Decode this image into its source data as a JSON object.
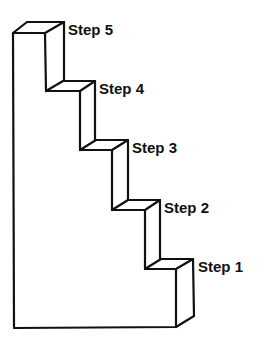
{
  "diagram": {
    "type": "staircase",
    "line_color": "#111111",
    "background_color": "#ffffff",
    "steps": [
      {
        "id": "step-5",
        "label": "Step 5",
        "level": 5
      },
      {
        "id": "step-4",
        "label": "Step 4",
        "level": 4
      },
      {
        "id": "step-3",
        "label": "Step 3",
        "level": 3
      },
      {
        "id": "step-2",
        "label": "Step 2",
        "level": 2
      },
      {
        "id": "step-1",
        "label": "Step 1",
        "level": 1
      }
    ]
  }
}
